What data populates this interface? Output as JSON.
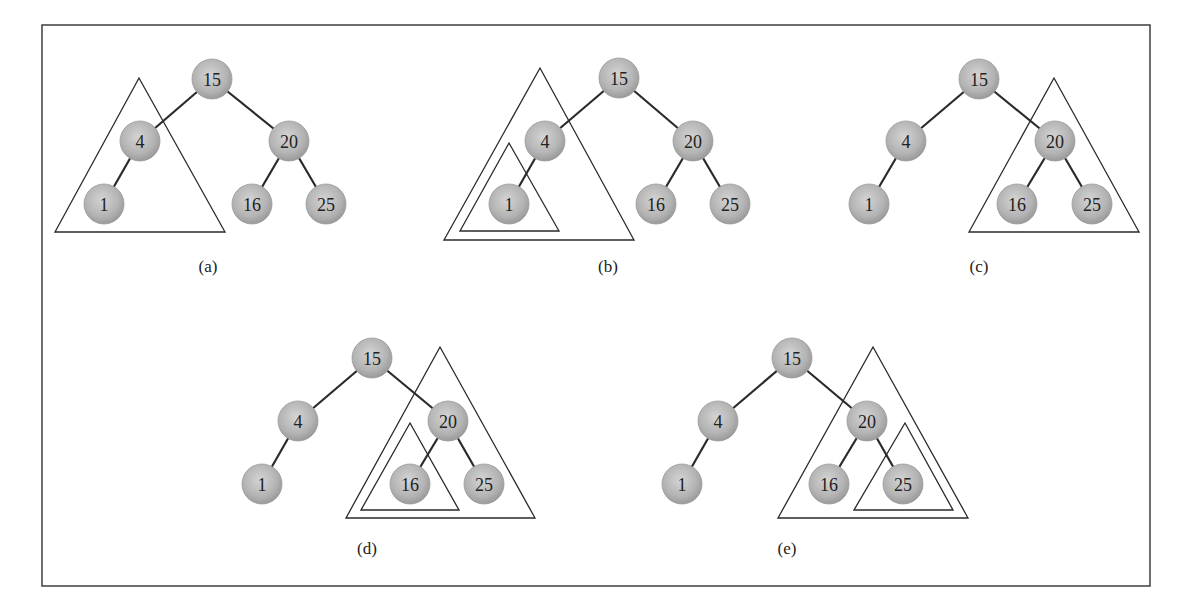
{
  "figure": {
    "frame": {
      "x": 42,
      "y": 25,
      "width": 1108,
      "height": 561
    },
    "colors": {
      "node_center": "#d4d4d4",
      "node_edge": "#9a9a9a",
      "line": "#2a2a2a",
      "frame": "#4a4a4a"
    },
    "tree": {
      "nodes": [
        "15",
        "4",
        "20",
        "1",
        "16",
        "25"
      ],
      "edges": [
        [
          "15",
          "4"
        ],
        [
          "15",
          "20"
        ],
        [
          "4",
          "1"
        ],
        [
          "20",
          "16"
        ],
        [
          "20",
          "25"
        ]
      ]
    },
    "panels": [
      {
        "caption": "(a)",
        "caption_pos": [
          208,
          266
        ],
        "nodes": {
          "15": [
            212,
            79
          ],
          "4": [
            140,
            141
          ],
          "20": [
            289,
            141
          ],
          "1": [
            104,
            204
          ],
          "16": [
            252,
            204
          ],
          "25": [
            326,
            204
          ]
        },
        "triangles": [
          [
            [
              139,
              78
            ],
            [
              55,
              232
            ],
            [
              225,
              232
            ]
          ]
        ],
        "highlighted_subtree": "4"
      },
      {
        "caption": "(b)",
        "caption_pos": [
          608,
          266
        ],
        "nodes": {
          "15": [
            619,
            78
          ],
          "4": [
            545,
            141
          ],
          "20": [
            693,
            141
          ],
          "1": [
            509,
            204
          ],
          "16": [
            656,
            204
          ],
          "25": [
            730,
            204
          ]
        },
        "triangles": [
          [
            [
              540,
              68
            ],
            [
              444,
              240
            ],
            [
              634,
              240
            ]
          ],
          [
            [
              509,
              143
            ],
            [
              460,
              231
            ],
            [
              559,
              231
            ]
          ]
        ],
        "highlighted_subtree": "1"
      },
      {
        "caption": "(c)",
        "caption_pos": [
          979,
          266
        ],
        "nodes": {
          "15": [
            979,
            79
          ],
          "4": [
            906,
            141
          ],
          "20": [
            1055,
            141
          ],
          "1": [
            869,
            204
          ],
          "16": [
            1017,
            204
          ],
          "25": [
            1092,
            204
          ]
        },
        "triangles": [
          [
            [
              1054,
              78
            ],
            [
              969,
              232
            ],
            [
              1139,
              232
            ]
          ]
        ],
        "highlighted_subtree": "20"
      },
      {
        "caption": "(d)",
        "caption_pos": [
          367,
          548
        ],
        "nodes": {
          "15": [
            372,
            358
          ],
          "4": [
            298,
            421
          ],
          "20": [
            448,
            421
          ],
          "1": [
            262,
            484
          ],
          "16": [
            410,
            484
          ],
          "25": [
            484,
            484
          ]
        },
        "triangles": [
          [
            [
              440,
              347
            ],
            [
              346,
              518
            ],
            [
              535,
              518
            ]
          ],
          [
            [
              410,
              423
            ],
            [
              361,
              510
            ],
            [
              459,
              510
            ]
          ]
        ],
        "highlighted_subtree": "16"
      },
      {
        "caption": "(e)",
        "caption_pos": [
          787,
          548
        ],
        "nodes": {
          "15": [
            792,
            358
          ],
          "4": [
            718,
            421
          ],
          "20": [
            867,
            421
          ],
          "1": [
            682,
            484
          ],
          "16": [
            829,
            484
          ],
          "25": [
            903,
            484
          ]
        },
        "triangles": [
          [
            [
              873,
              347
            ],
            [
              778,
              518
            ],
            [
              968,
              518
            ]
          ],
          [
            [
              905,
              423
            ],
            [
              854,
              510
            ],
            [
              953,
              510
            ]
          ]
        ],
        "highlighted_subtree": "25"
      }
    ]
  }
}
